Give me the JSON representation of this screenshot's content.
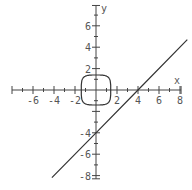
{
  "chart_data": {
    "type": "line",
    "title": "",
    "xlabel": "x",
    "ylabel": "y",
    "xlim": [
      -8,
      8.7
    ],
    "ylim": [
      -8.3,
      8
    ],
    "grid": false,
    "x_ticks": [
      -6,
      -4,
      -2,
      2,
      4,
      6,
      8
    ],
    "y_ticks": [
      6,
      4,
      2,
      -4,
      -6,
      -8
    ],
    "x_tick_labels": [
      "-6",
      "-4",
      "-2",
      "2",
      "4",
      "6",
      "8"
    ],
    "y_tick_labels": [
      "6",
      "4",
      "2",
      "-4",
      "-6",
      "-8"
    ],
    "series": [
      {
        "name": "line y = x - 4",
        "kind": "line",
        "points": [
          [
            -4.2,
            -8.2
          ],
          [
            0,
            -4
          ],
          [
            4,
            0
          ],
          [
            8.7,
            4.7
          ]
        ]
      },
      {
        "name": "closed rounded curve about origin",
        "kind": "closed-curve",
        "center": [
          0,
          0
        ],
        "half_width": 1.4,
        "half_height": 1.4
      }
    ],
    "colors": {
      "axis": "#444444",
      "curve": "#333333",
      "label": "#555555",
      "background": "#ffffff"
    }
  }
}
